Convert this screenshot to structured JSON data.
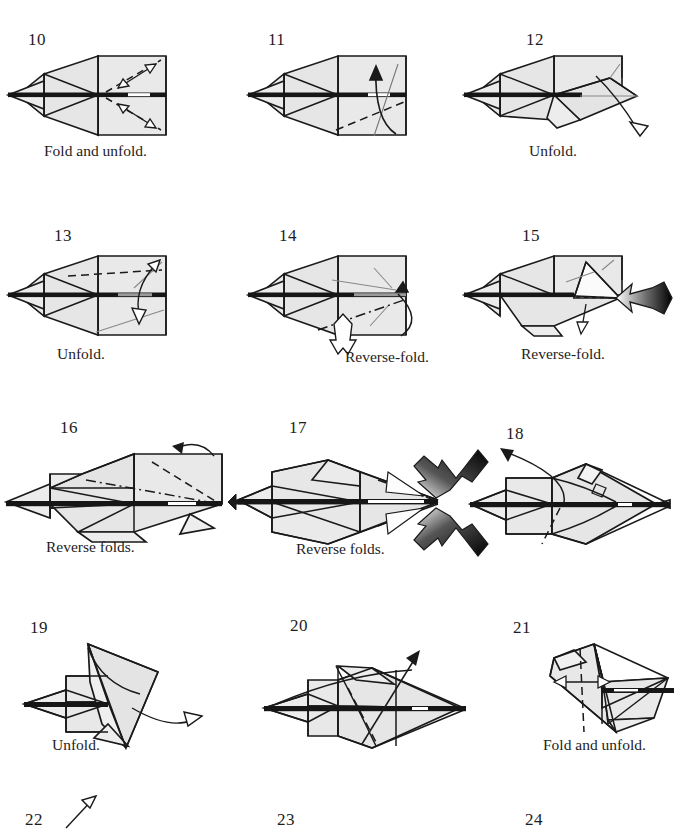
{
  "document": {
    "kind": "origami-instruction-diagram",
    "subject": "paper airplane / jet folding sequence",
    "page_background": "#ffffff",
    "ink_color": "#1a1a1a",
    "paper_fill": "#e9e9e9",
    "paper_fill_shaded": "#dedede",
    "arrow_fill": "#ffffff",
    "push_arrow_gradient": [
      "#000000",
      "#ffffff"
    ],
    "columns": 3,
    "rows": 4
  },
  "steps": [
    {
      "number": "10",
      "caption": "Fold and unfold.",
      "has_caption": true,
      "number_x": 28,
      "number_y": 30,
      "caption_x": 44,
      "caption_y": 142,
      "fig_x": 6,
      "fig_y": 48
    },
    {
      "number": "11",
      "caption": "",
      "has_caption": false,
      "number_x": 268,
      "number_y": 30,
      "caption_x": 0,
      "caption_y": 0,
      "fig_x": 246,
      "fig_y": 48
    },
    {
      "number": "12",
      "caption": "Unfold.",
      "has_caption": true,
      "number_x": 526,
      "number_y": 30,
      "caption_x": 529,
      "caption_y": 142,
      "fig_x": 462,
      "fig_y": 48
    },
    {
      "number": "13",
      "caption": "Unfold.",
      "has_caption": true,
      "number_x": 54,
      "number_y": 226,
      "caption_x": 57,
      "caption_y": 345,
      "fig_x": 6,
      "fig_y": 248
    },
    {
      "number": "14",
      "caption": "Reverse-fold.",
      "has_caption": true,
      "number_x": 279,
      "number_y": 226,
      "caption_x": 345,
      "caption_y": 348,
      "fig_x": 246,
      "fig_y": 248
    },
    {
      "number": "15",
      "caption": "Reverse-fold.",
      "has_caption": true,
      "number_x": 522,
      "number_y": 226,
      "caption_x": 521,
      "caption_y": 345,
      "fig_x": 462,
      "fig_y": 248
    },
    {
      "number": "16",
      "caption": "Reverse folds.",
      "has_caption": true,
      "number_x": 60,
      "number_y": 418,
      "caption_x": 46,
      "caption_y": 538,
      "fig_x": 0,
      "fig_y": 432
    },
    {
      "number": "17",
      "caption": "Reverse folds.",
      "has_caption": true,
      "number_x": 289,
      "number_y": 418,
      "caption_x": 296,
      "caption_y": 540,
      "fig_x": 238,
      "fig_y": 430
    },
    {
      "number": "18",
      "caption": "",
      "has_caption": false,
      "number_x": 506,
      "number_y": 424,
      "caption_x": 0,
      "caption_y": 0,
      "fig_x": 456,
      "fig_y": 436
    },
    {
      "number": "19",
      "caption": "Unfold.",
      "has_caption": true,
      "number_x": 30,
      "number_y": 618,
      "caption_x": 52,
      "caption_y": 736,
      "fig_x": 10,
      "fig_y": 620
    },
    {
      "number": "20",
      "caption": "",
      "has_caption": false,
      "number_x": 290,
      "number_y": 616,
      "caption_x": 0,
      "caption_y": 0,
      "fig_x": 236,
      "fig_y": 626
    },
    {
      "number": "21",
      "caption": "Fold and unfold.",
      "has_caption": true,
      "number_x": 513,
      "number_y": 618,
      "caption_x": 543,
      "caption_y": 736,
      "fig_x": 468,
      "fig_y": 620
    },
    {
      "number": "22",
      "caption": "",
      "has_caption": false,
      "number_x": 25,
      "number_y": 810,
      "caption_x": 0,
      "caption_y": 0,
      "fig_x": 60,
      "fig_y": 796
    },
    {
      "number": "23",
      "caption": "",
      "has_caption": false,
      "number_x": 277,
      "number_y": 810,
      "caption_x": 0,
      "caption_y": 0,
      "fig_x": 0,
      "fig_y": 0
    },
    {
      "number": "24",
      "caption": "",
      "has_caption": false,
      "number_x": 525,
      "number_y": 810,
      "caption_x": 0,
      "caption_y": 0,
      "fig_x": 0,
      "fig_y": 0
    }
  ],
  "legend": {
    "solid_line": "fold edge / paper boundary",
    "dashed_line": "valley fold",
    "dash_dot_line": "mountain fold",
    "open_arrow": "fold direction",
    "hollow_pointer_arrow": "push here",
    "gradient_arrow": "push / reverse-fold here"
  }
}
